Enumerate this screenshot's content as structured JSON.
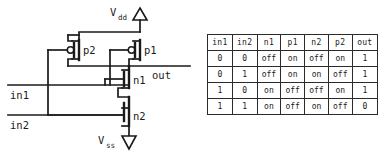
{
  "figure": {
    "kind": "cmos-nand-gate-schematic-with-truth-table"
  },
  "circuit": {
    "supply_top": {
      "label_main": "V",
      "label_sub": "dd",
      "symbol": "up-triangle-supply-icon"
    },
    "supply_bottom": {
      "label_main": "V",
      "label_sub": "ss",
      "symbol": "down-triangle-ground-icon"
    },
    "transistors": [
      {
        "id": "p2",
        "label": "p2",
        "type": "pmos"
      },
      {
        "id": "p1",
        "label": "p1",
        "type": "pmos"
      },
      {
        "id": "n1",
        "label": "n1",
        "type": "nmos"
      },
      {
        "id": "n2",
        "label": "n2",
        "type": "nmos"
      }
    ],
    "inputs": [
      {
        "id": "in1",
        "label": "in1"
      },
      {
        "id": "in2",
        "label": "in2"
      }
    ],
    "outputs": [
      {
        "id": "out",
        "label": "out"
      }
    ],
    "colors": {
      "ink": "#1a1a1a",
      "background": "#ffffff"
    }
  },
  "truth_table": {
    "headers": [
      "in1",
      "in2",
      "n1",
      "p1",
      "n2",
      "p2",
      "out"
    ],
    "rows": [
      [
        "0",
        "0",
        "off",
        "on",
        "off",
        "on",
        "1"
      ],
      [
        "0",
        "1",
        "off",
        "on",
        "on",
        "off",
        "1"
      ],
      [
        "1",
        "0",
        "on",
        "off",
        "off",
        "on",
        "1"
      ],
      [
        "1",
        "1",
        "on",
        "off",
        "on",
        "off",
        "0"
      ]
    ]
  }
}
